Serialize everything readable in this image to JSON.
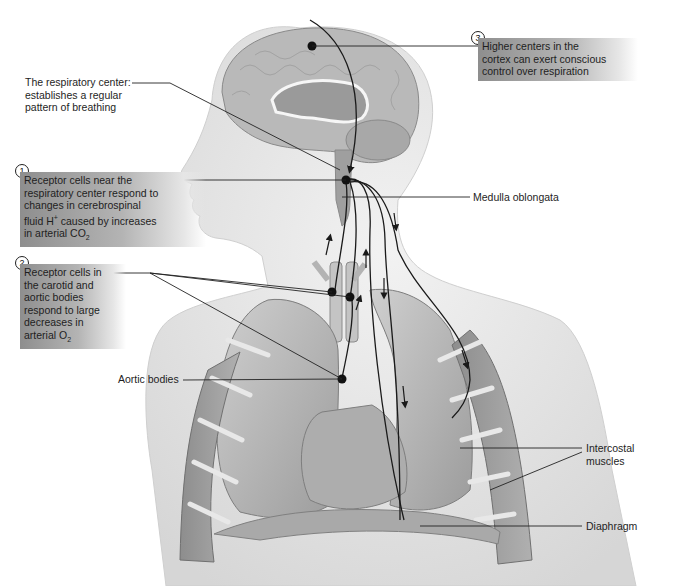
{
  "figure": {
    "colors": {
      "silhouette": "#e4e4e4",
      "tissue": "#b8b8b8",
      "nerve": "#1a1a1a",
      "label_box": "#9a9a9a"
    }
  },
  "callouts": [
    {
      "number": "3",
      "text_lines": [
        "Higher centers in the",
        "cortex can exert conscious",
        "control over respiration"
      ]
    },
    {
      "number": "1",
      "text_lines": [
        "Receptor cells near the",
        "respiratory center respond to",
        "changes in cerebrospinal",
        "fluid H",
        "caused by increases",
        "in arterial CO"
      ],
      "superscript": "+",
      "subscript": "2"
    },
    {
      "number": "2",
      "text_lines": [
        "Receptor cells in",
        "the carotid and",
        "aortic bodies",
        "respond to large",
        "decreases in",
        "arterial O"
      ],
      "subscript": "2"
    }
  ],
  "labels": {
    "respiratory_center": [
      "The respiratory center:",
      "establishes a regular",
      "pattern of breathing"
    ],
    "medulla": "Medulla oblongata",
    "aortic_bodies": "Aortic bodies",
    "intercostal": [
      "Intercostal",
      "muscles"
    ],
    "diaphragm": "Diaphragm"
  }
}
